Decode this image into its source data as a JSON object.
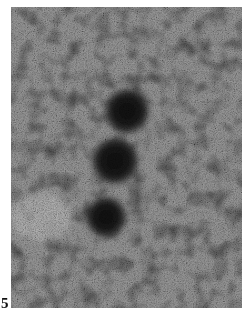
{
  "figure": {
    "panel_label": "5",
    "particles": [
      {
        "cx": 116,
        "cy": 104,
        "r": 22
      },
      {
        "cx": 104,
        "cy": 154,
        "r": 23
      },
      {
        "cx": 95,
        "cy": 210,
        "r": 20
      }
    ],
    "colors": {
      "background_mid": "#9a9a9a",
      "particle": "#1a1a1a",
      "light_patch": "#d8d8d8"
    }
  }
}
